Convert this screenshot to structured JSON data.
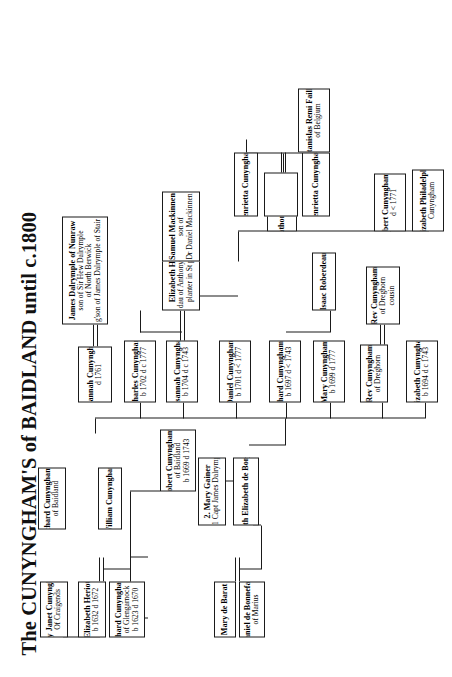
{
  "title": "The CUNYNGHAM'S of BAIDLAND until c.1800",
  "nodes": [
    {
      "id": "mary_de_barat",
      "name": "Mary de Barat",
      "lines": []
    },
    {
      "id": "daniel_de_bonnefant",
      "name": "Daniel de Bonnefant",
      "lines": [
        "of Marius"
      ]
    },
    {
      "id": "judith_bonnefant",
      "name": "1.  Judith Elizabeth de Bonnefant",
      "lines": []
    },
    {
      "id": "mary_gainer",
      "name": "2.  Mary Gainer",
      "lines": [
        "m 1 Capt James Dalrymple"
      ]
    },
    {
      "id": "elizabeth_heriot",
      "name": "Elizabeth Heriot",
      "lines": [
        "b 1632   d 1672"
      ]
    },
    {
      "id": "richard_cunyngham_i",
      "name": "Richard Cunyngham I",
      "lines": [
        "of Glengarnock",
        "b 1623 d 1670"
      ]
    },
    {
      "id": "lady_janet_cunyngham",
      "name": "Lady Janet Cunyngham",
      "lines": [
        "Of Craigends"
      ]
    },
    {
      "id": "richard_cunyngham_ii",
      "name": "Richard Cunyngham II",
      "lines": [
        "of Baidland"
      ]
    },
    {
      "id": "william_cunyngham",
      "name": "William Cunyngham",
      "lines": []
    },
    {
      "id": "robert_cunyngham_i",
      "name": "Robert Cunyngham I",
      "lines": [
        "of Baidland",
        "b 1669 d 1743"
      ]
    },
    {
      "id": "james_dalrymple",
      "name": "James Dalrymple of Nunraw",
      "lines": [
        "son of Sir Hew Dalrymple",
        "of North Berwick",
        "g'son of James Dalrymple of Stair"
      ]
    },
    {
      "id": "susannah_cunyngham_1761",
      "name": "Susannah Cunyngham",
      "lines": [
        "d 1761"
      ]
    },
    {
      "id": "elizabeth_hodge",
      "name": "Elizabeth Hodge",
      "lines": [
        "dau of Anthony Hodge",
        "planter in St peters"
      ]
    },
    {
      "id": "charles_cunyngham",
      "name": "Charles Cunyngham",
      "lines": [
        "b 1702  d c 1777"
      ]
    },
    {
      "id": "samuel_mackinnen",
      "name": "Samuel Mackinnen",
      "lines": [
        "son of",
        "Dr Daniel  Mackinnen"
      ]
    },
    {
      "id": "susannah_cunyngham_1704",
      "name": "Susannah Cunyngham",
      "lines": [
        "b 1704 d  c 1743"
      ]
    },
    {
      "id": "daniel_cunyngham",
      "name": "Daniel Cunyngham",
      "lines": [
        "b 1701 d < 1777"
      ]
    },
    {
      "id": "richard_cunyngham_iii",
      "name": "Richard Cunyngham III",
      "lines": [
        "b 1697 d  < 1743"
      ]
    },
    {
      "id": "isaac_roberdeau",
      "name": "Isaac Roberdeau",
      "lines": []
    },
    {
      "id": "mary_cunyngham",
      "name": "Mary Cunyngham",
      "lines": [
        "b 1699  d  1777"
      ]
    },
    {
      "id": "rev_cunyngham_dreghorn_top",
      "name": "Rev Cunyngham",
      "lines": [
        "of Dreghorn"
      ]
    },
    {
      "id": "elizabeth_cunyngham",
      "name": "Elizabeth Cunyngham",
      "lines": [
        "b 1694 d c 1743"
      ]
    },
    {
      "id": "rev_cunyngham_cousin",
      "name": "Rev Cunyngham",
      "lines": [
        "of Dreghorn",
        "cousin"
      ]
    },
    {
      "id": "henrietta_cunyngham_top",
      "name": "Henrietta Cunyngham",
      "lines": []
    },
    {
      "id": "stanislas_remi_faille",
      "name": "Stanislas Remi Faille",
      "lines": [
        "of Belgium"
      ]
    },
    {
      "id": "anthony_cunyngham",
      "name": "Anthony Cunyngham",
      "lines": []
    },
    {
      "id": "henrietta_cunyngham_2",
      "name": "Henrietta Cunyngham",
      "lines": []
    },
    {
      "id": "robert_cunyngham_ii",
      "name": "Robert Cunyngham II",
      "lines": [
        "d < 1771"
      ]
    },
    {
      "id": "elizabeth_philadelphia",
      "name": "Elizabeth Philadelphia",
      "lines": [
        "Cunyngham"
      ]
    },
    {
      "id": "blank_node",
      "name": "",
      "lines": []
    }
  ]
}
